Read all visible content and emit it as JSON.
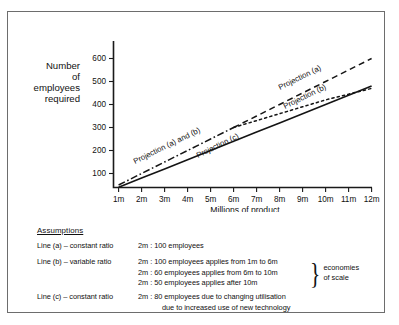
{
  "figure": {
    "y_axis_label_lines": [
      "Number",
      "of",
      "employees",
      "required"
    ],
    "x_axis_title": "Millions of product"
  },
  "chart_data": {
    "type": "line",
    "title": "",
    "xlabel": "Millions of product",
    "ylabel": "Number of employees required",
    "xlim": [
      0,
      12.6
    ],
    "ylim": [
      0,
      650
    ],
    "grid": false,
    "legend_position": "inline-annotations",
    "x_tick_labels": [
      "1m",
      "2m",
      "3m",
      "4m",
      "5m",
      "6m",
      "7m",
      "8m",
      "9m",
      "10m",
      "11m",
      "12m"
    ],
    "x_tick_values": [
      1,
      2,
      3,
      4,
      5,
      6,
      7,
      8,
      9,
      10,
      11,
      12
    ],
    "y_tick_labels": [
      "100",
      "200",
      "300",
      "400",
      "500",
      "600"
    ],
    "y_tick_values": [
      100,
      200,
      300,
      400,
      500,
      600
    ],
    "x": [
      1,
      2,
      3,
      4,
      5,
      6,
      7,
      8,
      9,
      10,
      11,
      12
    ],
    "series": [
      {
        "name": "Projection (a)",
        "style": "dashed",
        "values": [
          50,
          100,
          150,
          200,
          250,
          300,
          350,
          400,
          450,
          500,
          550,
          600
        ]
      },
      {
        "name": "Projection (b)",
        "style": "dotted",
        "values": [
          50,
          100,
          150,
          200,
          250,
          300,
          330,
          360,
          390,
          420,
          445,
          470
        ]
      },
      {
        "name": "Projection (c)",
        "style": "solid",
        "values": [
          40,
          80,
          120,
          160,
          200,
          240,
          280,
          320,
          360,
          400,
          440,
          480
        ]
      }
    ],
    "annotations": [
      {
        "text": "Projection (a) and (b)",
        "x": 2.4,
        "y": 150
      },
      {
        "text": "Projection (c)",
        "x": 5.1,
        "y": 175
      },
      {
        "text": "Projection (a)",
        "x": 9.2,
        "y": 420
      },
      {
        "text": "Projection (b)",
        "x": 9.6,
        "y": 355
      }
    ]
  },
  "assumptions": {
    "heading": "Assumptions",
    "rows": [
      {
        "label": "Line (a) – constant ratio",
        "lines": [
          {
            "indent": false,
            "text": "2m : 100 employees"
          }
        ]
      },
      {
        "label": "Line (b) – variable ratio",
        "lines": [
          {
            "indent": false,
            "text": "2m : 100 employees applies from 1m to 6m"
          },
          {
            "indent": false,
            "text": "2m : 60 employees applies from 6m to 10m"
          },
          {
            "indent": false,
            "text": "2m : 50 employees applies after 10m"
          }
        ]
      },
      {
        "label": "Line (c) – constant ratio",
        "lines": [
          {
            "indent": false,
            "text": "2m : 80 employees due to changing utilisation"
          },
          {
            "indent": true,
            "text": "due to increased use of new technology"
          }
        ]
      }
    ],
    "brace_caption_lines": [
      "economies",
      "of scale"
    ],
    "brace_glyph": "}"
  }
}
